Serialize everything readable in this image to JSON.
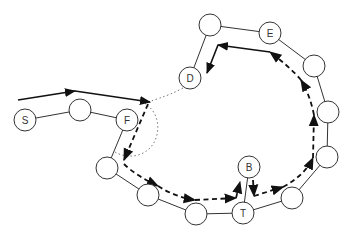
{
  "diagram": {
    "nodes": [
      {
        "id": "S",
        "label": "S",
        "x": 25,
        "y": 120
      },
      {
        "id": "n2",
        "label": "",
        "x": 80,
        "y": 110
      },
      {
        "id": "F",
        "label": "F",
        "x": 127,
        "y": 120
      },
      {
        "id": "n4",
        "label": "",
        "x": 107,
        "y": 168
      },
      {
        "id": "n5",
        "label": "",
        "x": 148,
        "y": 195
      },
      {
        "id": "n6",
        "label": "",
        "x": 196,
        "y": 214
      },
      {
        "id": "T",
        "label": "T",
        "x": 243,
        "y": 213
      },
      {
        "id": "B",
        "label": "B",
        "x": 249,
        "y": 167
      },
      {
        "id": "n9",
        "label": "",
        "x": 292,
        "y": 198
      },
      {
        "id": "n10",
        "label": "",
        "x": 327,
        "y": 157
      },
      {
        "id": "n11",
        "label": "",
        "x": 328,
        "y": 112
      },
      {
        "id": "n12",
        "label": "",
        "x": 314,
        "y": 66
      },
      {
        "id": "E",
        "label": "E",
        "x": 270,
        "y": 33
      },
      {
        "id": "n14",
        "label": "",
        "x": 210,
        "y": 25
      },
      {
        "id": "D",
        "label": "D",
        "x": 190,
        "y": 78
      }
    ],
    "edges": [
      [
        "S",
        "n2"
      ],
      [
        "n2",
        "F"
      ],
      [
        "F",
        "n4"
      ],
      [
        "n4",
        "n5"
      ],
      [
        "n5",
        "n6"
      ],
      [
        "n6",
        "T"
      ],
      [
        "T",
        "B"
      ],
      [
        "T",
        "n9"
      ],
      [
        "n9",
        "n10"
      ],
      [
        "n10",
        "n11"
      ],
      [
        "n11",
        "n12"
      ],
      [
        "n12",
        "E"
      ],
      [
        "E",
        "n14"
      ],
      [
        "n14",
        "D"
      ]
    ],
    "node_radius": 11,
    "colors": {
      "stroke": "#333333",
      "fill": "#ffffff",
      "arrow": "#111111",
      "dotted": "#777777"
    }
  }
}
